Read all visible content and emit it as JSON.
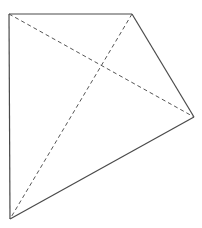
{
  "figure": {
    "type": "quadrilateral-with-diagonals",
    "stroke_color": "#4a4a4a",
    "dash_color": "#555555",
    "vertices": {
      "A": {
        "x": 9,
        "y": 14
      },
      "B": {
        "x": 132,
        "y": 14
      },
      "C": {
        "x": 194,
        "y": 117
      },
      "D": {
        "x": 10,
        "y": 219
      }
    },
    "edges": [
      {
        "from": "A",
        "to": "B",
        "style": "solid"
      },
      {
        "from": "B",
        "to": "C",
        "style": "solid"
      },
      {
        "from": "C",
        "to": "D",
        "style": "solid"
      },
      {
        "from": "D",
        "to": "A",
        "style": "solid"
      }
    ],
    "diagonals": [
      {
        "from": "A",
        "to": "C",
        "style": "dashed"
      },
      {
        "from": "B",
        "to": "D",
        "style": "dashed"
      }
    ]
  }
}
